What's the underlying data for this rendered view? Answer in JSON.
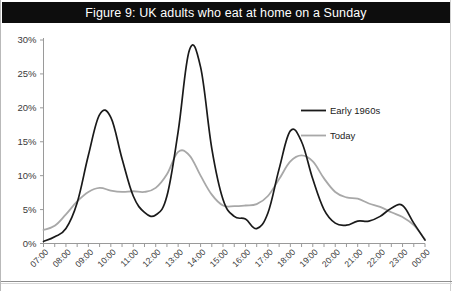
{
  "figure": {
    "title": "Figure 9: UK adults who eat at home on a Sunday",
    "title_band_color": "#0d0d0d",
    "title_text_color": "#ffffff",
    "background_color": "#ffffff"
  },
  "legend": {
    "position": "inside-upper-right",
    "entries": [
      {
        "label": "Early 1960s",
        "color": "#1a1a1a"
      },
      {
        "label": "Today",
        "color": "#a8a8a8"
      }
    ]
  },
  "axes": {
    "y_ticks": [
      "0%",
      "5%",
      "10%",
      "15%",
      "20%",
      "25%",
      "30%"
    ],
    "x_ticks": [
      "07:00",
      "08:00",
      "09:00",
      "10:00",
      "11:00",
      "12:00",
      "13:00",
      "14:00",
      "15:00",
      "16:00",
      "17:00",
      "18:00",
      "19:00",
      "20:00",
      "21:00",
      "22:00",
      "23:00",
      "00:00"
    ]
  },
  "chart_data": {
    "type": "line",
    "title": "Figure 9: UK adults who eat at home on a Sunday",
    "xlabel": "",
    "ylabel": "",
    "ylim": [
      0,
      30
    ],
    "ytick_values": [
      0,
      5,
      10,
      15,
      20,
      25,
      30
    ],
    "ytick_labels": [
      "0%",
      "5%",
      "10%",
      "15%",
      "20%",
      "25%",
      "30%"
    ],
    "grid": false,
    "legend_position": "inside-upper-right",
    "x": [
      "07:00",
      "07:30",
      "08:00",
      "08:30",
      "09:00",
      "09:30",
      "10:00",
      "10:30",
      "11:00",
      "11:30",
      "12:00",
      "12:30",
      "13:00",
      "13:30",
      "14:00",
      "14:30",
      "15:00",
      "15:30",
      "16:00",
      "16:30",
      "17:00",
      "17:30",
      "18:00",
      "18:30",
      "19:00",
      "19:30",
      "20:00",
      "20:30",
      "21:00",
      "21:30",
      "22:00",
      "22:30",
      "23:00",
      "23:30",
      "00:00"
    ],
    "series": [
      {
        "name": "Early 1960s",
        "color": "#1a1a1a",
        "values": [
          0.3,
          1.0,
          2.2,
          6.0,
          13.0,
          19.0,
          18.6,
          12.5,
          7.0,
          4.6,
          4.2,
          7.0,
          16.5,
          28.5,
          26.0,
          14.0,
          6.5,
          4.0,
          3.6,
          2.2,
          4.5,
          11.0,
          16.6,
          15.0,
          9.5,
          5.0,
          3.0,
          2.7,
          3.3,
          3.3,
          4.0,
          5.2,
          5.6,
          3.0,
          0.5
        ]
      },
      {
        "name": "Today",
        "color": "#a8a8a8",
        "values": [
          2.0,
          2.6,
          4.3,
          6.2,
          7.6,
          8.2,
          7.8,
          7.6,
          7.7,
          7.6,
          8.2,
          10.2,
          13.5,
          13.0,
          10.0,
          7.2,
          5.6,
          5.5,
          5.6,
          5.8,
          7.0,
          9.5,
          12.1,
          13.0,
          12.1,
          9.6,
          7.6,
          6.8,
          6.6,
          5.9,
          5.4,
          4.6,
          3.9,
          2.7,
          0.6
        ]
      }
    ],
    "annotations": [
      "Black line peaks around 09:30 (19%), 13:30 (28.5%), 18:00 (16.6%) with a late bump near 23:00 (5.6%)",
      "Grey line peaks around 13:00 (13.5%) and 18:30 (13%)"
    ]
  }
}
